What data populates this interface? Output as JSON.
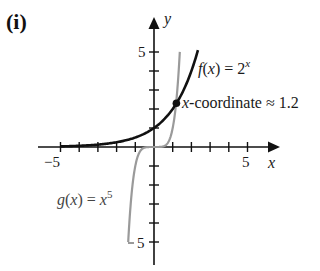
{
  "panel_label": "(i)",
  "chart_data": {
    "type": "line",
    "title": "",
    "xlabel": "x",
    "ylabel": "y",
    "xlim": [
      -5.5,
      5.8
    ],
    "ylim": [
      -5.7,
      5.5
    ],
    "x_ticks": [
      -5,
      -4,
      -3,
      -2,
      -1,
      1,
      2,
      3,
      4,
      5
    ],
    "x_tick_labels": {
      "-5": "−5",
      "5": "5"
    },
    "y_ticks": [
      -5,
      -4,
      -3,
      -2,
      -1,
      1,
      2,
      3,
      4,
      5
    ],
    "y_tick_labels": {
      "5": "5",
      "-5": "−5"
    },
    "grid": false,
    "series": [
      {
        "name": "f(x) = 2^x",
        "label_text": "f(x) = 2",
        "label_sup": "x",
        "color": "#111111",
        "function": "2^x",
        "x_range": [
          -5,
          2.35
        ],
        "points": [
          [
            -5,
            0.031
          ],
          [
            -4,
            0.063
          ],
          [
            -3,
            0.125
          ],
          [
            -2,
            0.25
          ],
          [
            -1,
            0.5
          ],
          [
            0,
            1
          ],
          [
            1,
            2
          ],
          [
            1.2,
            2.3
          ],
          [
            2,
            4
          ],
          [
            2.3,
            4.9
          ]
        ]
      },
      {
        "name": "g(x) = x^5",
        "label_text": "g(x) = x",
        "label_sup": "5",
        "color": "#9a9a9a",
        "function": "x^5",
        "x_range": [
          -1.38,
          1.38
        ],
        "points": [
          [
            -1.38,
            -5
          ],
          [
            -1.2,
            -2.49
          ],
          [
            -1,
            -1
          ],
          [
            -0.5,
            -0.03
          ],
          [
            0,
            0
          ],
          [
            0.5,
            0.03
          ],
          [
            1,
            1
          ],
          [
            1.2,
            2.49
          ],
          [
            1.38,
            5
          ]
        ]
      }
    ],
    "annotations": [
      {
        "text": "x-coordinate ≈ 1.2",
        "x": 1.2,
        "y": 2.3,
        "marker": "dot"
      }
    ]
  }
}
